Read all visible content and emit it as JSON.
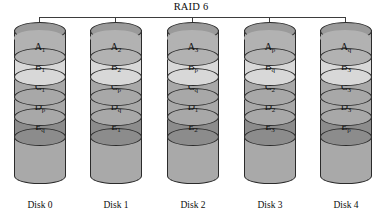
{
  "diagram": {
    "title": "RAID 6",
    "bus_color": "#3d3d3d",
    "colors": {
      "cylinder_body": "#a9a9a9",
      "top_ellipse": "#9a9a9a",
      "band_medium": "#b2b2b2",
      "band_light": "#d8d8d8",
      "band_mid": "#a8a8a8",
      "band_dark": "#8c8c8c",
      "outline": "#2b2b2b",
      "background": "#ffffff"
    },
    "row_shades": [
      "band_medium",
      "band_light",
      "band_mid",
      "band_mid",
      "band_dark"
    ],
    "disks": [
      {
        "caption": "Disk 0",
        "bands": [
          {
            "base": "A",
            "sub": "1"
          },
          {
            "base": "B",
            "sub": "1"
          },
          {
            "base": "C",
            "sub": "1"
          },
          {
            "base": "D",
            "sub": "p"
          },
          {
            "base": "E",
            "sub": "q"
          }
        ]
      },
      {
        "caption": "Disk 1",
        "bands": [
          {
            "base": "A",
            "sub": "2"
          },
          {
            "base": "B",
            "sub": "2"
          },
          {
            "base": "C",
            "sub": "p"
          },
          {
            "base": "D",
            "sub": "q"
          },
          {
            "base": "E",
            "sub": "1"
          }
        ]
      },
      {
        "caption": "Disk 2",
        "bands": [
          {
            "base": "A",
            "sub": "3"
          },
          {
            "base": "B",
            "sub": "p"
          },
          {
            "base": "C",
            "sub": "q"
          },
          {
            "base": "D",
            "sub": "1"
          },
          {
            "base": "E",
            "sub": "2"
          }
        ]
      },
      {
        "caption": "Disk 3",
        "bands": [
          {
            "base": "A",
            "sub": "p"
          },
          {
            "base": "B",
            "sub": "q"
          },
          {
            "base": "C",
            "sub": "2"
          },
          {
            "base": "D",
            "sub": "2"
          },
          {
            "base": "E",
            "sub": "3"
          }
        ]
      },
      {
        "caption": "Disk 4",
        "bands": [
          {
            "base": "A",
            "sub": "q"
          },
          {
            "base": "B",
            "sub": "3"
          },
          {
            "base": "C",
            "sub": "3"
          },
          {
            "base": "D",
            "sub": "3"
          },
          {
            "base": "E",
            "sub": "p"
          }
        ]
      }
    ]
  }
}
